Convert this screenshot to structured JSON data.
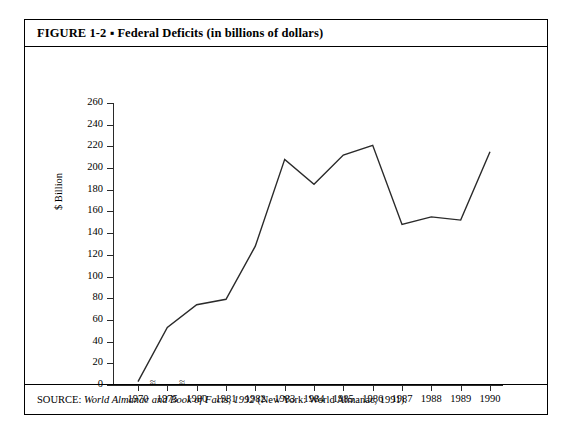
{
  "figure": {
    "title": "FIGURE 1-2 ▪ Federal Deficits (in billions of dollars)",
    "source_prefix": "SOURCE: ",
    "source_italic": "World Almanac and Book of Facts, 1992",
    "source_suffix": " (New York: World Almanac, 1991)."
  },
  "axis": {
    "y_title": "$ Billion",
    "break_mark": "≈"
  },
  "chart_data": {
    "type": "line",
    "title": "FIGURE 1-2 ▪ Federal Deficits (in billions of dollars)",
    "xlabel": "",
    "ylabel": "$ Billion",
    "categories": [
      "1970",
      "1975",
      "1980",
      "1981",
      "1982",
      "1983",
      "1984",
      "1985",
      "1986",
      "1987",
      "1988",
      "1989",
      "1990"
    ],
    "values": [
      3,
      53,
      74,
      79,
      128,
      208,
      185,
      212,
      221,
      148,
      155,
      152,
      215
    ],
    "ylim": [
      0,
      260
    ],
    "yticks": [
      0,
      20,
      40,
      60,
      80,
      100,
      120,
      140,
      160,
      180,
      200,
      220,
      240,
      260
    ],
    "ytick_labels": [
      "0",
      "20",
      "40",
      "60",
      "80",
      "100",
      "120",
      "140",
      "160",
      "180",
      "200",
      "220",
      "240",
      "260"
    ],
    "xtick_labels": [
      "1970",
      "1975",
      "1980",
      "1981",
      "1982",
      "1983",
      "1984",
      "1985",
      "1986",
      "1987",
      "1988",
      "1989",
      "1990"
    ],
    "axis_breaks": [
      "1970-1975",
      "1975-1980"
    ],
    "grid": false,
    "legend": false,
    "line_color": "#2a2a2a",
    "markers": false
  }
}
